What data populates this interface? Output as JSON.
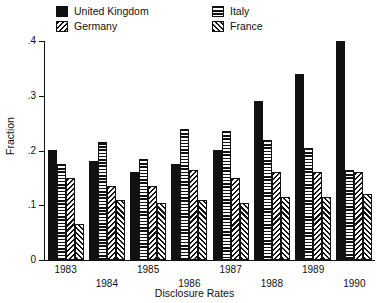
{
  "chart_data": {
    "type": "bar",
    "title": "",
    "xlabel": "Disclosure Rates",
    "ylabel": "Fraction",
    "categories": [
      "1983",
      "1984",
      "1985",
      "1986",
      "1987",
      "1988",
      "1989",
      "1990"
    ],
    "ylim": [
      0,
      0.4
    ],
    "yticks": [
      0,
      0.1,
      0.2,
      0.3,
      0.4
    ],
    "ytick_labels": [
      "0",
      ".1",
      ".2",
      ".3",
      ".4"
    ],
    "grid": false,
    "legend_position": "top",
    "series": [
      {
        "name": "United Kingdom",
        "pattern": "solid-black",
        "color": "#111111",
        "values": [
          0.2,
          0.18,
          0.16,
          0.175,
          0.2,
          0.29,
          0.34,
          0.4
        ]
      },
      {
        "name": "Italy",
        "pattern": "horizontal-lines",
        "color": "#111111",
        "values": [
          0.175,
          0.215,
          0.185,
          0.24,
          0.235,
          0.22,
          0.205,
          0.165
        ]
      },
      {
        "name": "Germany",
        "pattern": "backslash-hatch",
        "color": "#111111",
        "values": [
          0.15,
          0.135,
          0.135,
          0.165,
          0.15,
          0.16,
          0.16,
          0.16
        ]
      },
      {
        "name": "France",
        "pattern": "forwardslash-hatch",
        "color": "#111111",
        "values": [
          0.065,
          0.11,
          0.105,
          0.11,
          0.105,
          0.115,
          0.115,
          0.12
        ]
      }
    ]
  },
  "legend": {
    "entries": [
      {
        "label": "United Kingdom",
        "fill_class": "f-uk"
      },
      {
        "label": "Germany",
        "fill_class": "f-de"
      },
      {
        "label": "Italy",
        "fill_class": "f-it"
      },
      {
        "label": "France",
        "fill_class": "f-fr"
      }
    ]
  }
}
